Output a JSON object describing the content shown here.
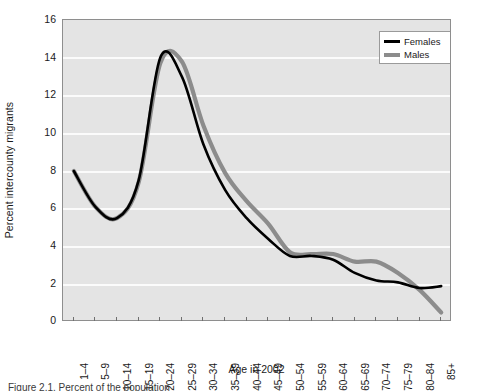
{
  "chart_data": {
    "type": "line",
    "title": "",
    "xlabel": "Age in 2002",
    "ylabel": "Percent intercounty migrants",
    "categories": [
      "1–4",
      "5–9",
      "10–14",
      "15–19",
      "20–24",
      "25–29",
      "30–34",
      "35–39",
      "40–44",
      "45–49",
      "50–54",
      "55–59",
      "60–64",
      "65–69",
      "70–74",
      "75–79",
      "80–84",
      "85+"
    ],
    "ylim": [
      0,
      16
    ],
    "yticks": [
      0,
      2,
      4,
      6,
      8,
      10,
      12,
      14,
      16
    ],
    "grid": "horizontal",
    "legend_position": "top-right-inside",
    "series": [
      {
        "name": "Females",
        "color": "#000000",
        "values": [
          8.0,
          6.1,
          5.5,
          7.5,
          14.0,
          13.0,
          9.4,
          7.0,
          5.5,
          4.4,
          3.5,
          3.5,
          3.3,
          2.6,
          2.2,
          2.1,
          1.8,
          1.9
        ]
      },
      {
        "name": "Males",
        "color": "#8c8c8c",
        "values": [
          8.0,
          6.1,
          5.5,
          7.4,
          13.7,
          13.8,
          10.4,
          7.9,
          6.4,
          5.2,
          3.7,
          3.6,
          3.6,
          3.2,
          3.2,
          2.6,
          1.7,
          0.5
        ]
      }
    ]
  },
  "legend": {
    "items": [
      {
        "label": "Females",
        "swatch": "legend-line-black"
      },
      {
        "label": "Males",
        "swatch": "legend-line-gray"
      }
    ]
  },
  "axes": {
    "y_title": "Percent intercounty migrants",
    "x_title": "Age in 2002",
    "y_tick_labels": [
      "16",
      "14",
      "12",
      "10",
      "8",
      "6",
      "4",
      "2",
      "0"
    ],
    "x_tick_labels": [
      "1–4",
      "5–9",
      "10–14",
      "15–19",
      "20–24",
      "25–29",
      "30–34",
      "35–39",
      "40–44",
      "45–49",
      "50–54",
      "55–59",
      "60–64",
      "65–69",
      "70–74",
      "75–79",
      "80–84",
      "85+"
    ]
  },
  "colors": {
    "plot_background": "#e4e4e4",
    "gridline": "#fbfbfb",
    "females_line": "#000000",
    "males_line": "#8c8c8c",
    "frame": "#8e8e8e"
  },
  "caption": {
    "text": "Figure 2.1.  Percent of the population"
  }
}
